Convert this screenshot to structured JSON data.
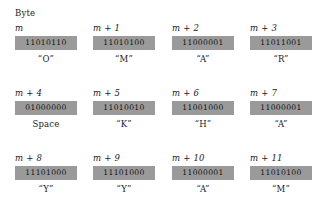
{
  "figure": {
    "header_label": "Byte",
    "box_color": "#9a9a9a",
    "background_color": "#ffffff",
    "text_color": "#1a1a1a"
  },
  "rows": [
    {
      "cells": [
        {
          "address": "m",
          "bits": "11010110",
          "character": "“O”"
        },
        {
          "address": "m + 1",
          "bits": "11010100",
          "character": "“M”"
        },
        {
          "address": "m + 2",
          "bits": "11000001",
          "character": "“A”"
        },
        {
          "address": "m + 3",
          "bits": "11011001",
          "character": "“R”"
        }
      ]
    },
    {
      "cells": [
        {
          "address": "m + 4",
          "bits": "01000000",
          "character": "Space"
        },
        {
          "address": "m + 5",
          "bits": "11010010",
          "character": "“K”"
        },
        {
          "address": "m + 6",
          "bits": "11001000",
          "character": "“H”"
        },
        {
          "address": "m + 7",
          "bits": "11000001",
          "character": "“A”"
        }
      ]
    },
    {
      "cells": [
        {
          "address": "m + 8",
          "bits": "11101000",
          "character": "“Y”"
        },
        {
          "address": "m + 9",
          "bits": "11101000",
          "character": "“Y”"
        },
        {
          "address": "m + 10",
          "bits": "11000001",
          "character": "“A”"
        },
        {
          "address": "m + 11",
          "bits": "11010100",
          "character": "“M”"
        }
      ]
    }
  ]
}
